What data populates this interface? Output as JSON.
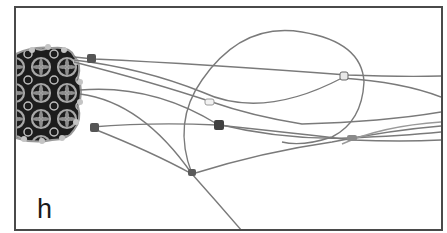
{
  "figure": {
    "panel_label": "h",
    "colors": {
      "frame": "#4a4a4a",
      "strand": "#7a7a7a",
      "filigree_dark": "#1c1c1c",
      "filigree_light": "#a8a8a8",
      "bead": "#555555",
      "background": "#ffffff"
    }
  }
}
